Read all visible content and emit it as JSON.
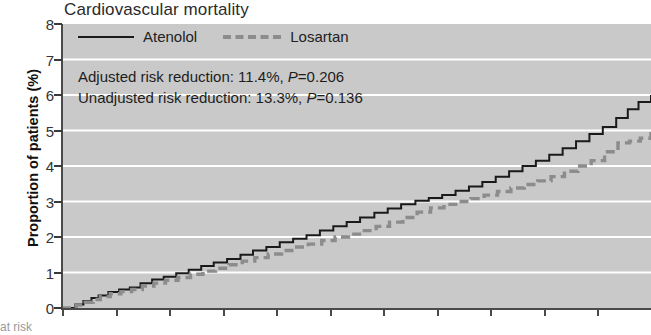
{
  "chart_data": {
    "type": "line",
    "title": "Cardiovascular mortality",
    "xlabel": "",
    "ylabel": "Proportion of patients (%)",
    "ylim": [
      0,
      8
    ],
    "yticks": [
      0,
      1,
      2,
      3,
      4,
      5,
      6,
      7,
      8
    ],
    "xlim": [
      0,
      66
    ],
    "xticks": [
      0,
      6,
      12,
      18,
      24,
      30,
      36,
      42,
      48,
      54,
      60,
      66
    ],
    "grid": true,
    "legend_position": "top-left",
    "plot_background": "#c9c9c9",
    "gridline_color": "#ffffff",
    "series": [
      {
        "name": "Atenolol",
        "style": "solid",
        "color": "#1a1a1a",
        "x": [
          0,
          1.5,
          2.4,
          3.3,
          4.1,
          5.2,
          6.4,
          7.6,
          8.8,
          10.1,
          11.4,
          12.8,
          14.2,
          15.6,
          17.0,
          18.5,
          20.0,
          21.4,
          22.9,
          24.4,
          25.9,
          27.4,
          28.9,
          30.4,
          31.9,
          33.4,
          35.0,
          36.5,
          38.0,
          39.6,
          41.1,
          42.6,
          44.1,
          45.6,
          47.1,
          48.6,
          50.1,
          51.6,
          53.1,
          54.6,
          56.1,
          57.6,
          59.1,
          60.6,
          62.1,
          63.4,
          64.6,
          66.0
        ],
        "y": [
          0.0,
          0.1,
          0.2,
          0.28,
          0.35,
          0.45,
          0.52,
          0.58,
          0.7,
          0.8,
          0.88,
          0.98,
          1.08,
          1.18,
          1.28,
          1.38,
          1.5,
          1.62,
          1.72,
          1.85,
          1.95,
          2.05,
          2.18,
          2.3,
          2.42,
          2.55,
          2.68,
          2.8,
          2.92,
          3.02,
          3.1,
          3.18,
          3.3,
          3.42,
          3.55,
          3.7,
          3.85,
          4.0,
          4.15,
          4.32,
          4.5,
          4.7,
          4.9,
          5.1,
          5.35,
          5.6,
          5.8,
          6.0
        ]
      },
      {
        "name": "Losartan",
        "style": "dashed",
        "color": "#8c8c8c",
        "x": [
          0,
          1.6,
          2.6,
          3.5,
          4.3,
          5.4,
          6.6,
          7.8,
          9.0,
          10.3,
          11.6,
          13.0,
          14.4,
          15.8,
          17.2,
          18.7,
          20.2,
          21.6,
          23.1,
          24.6,
          26.1,
          27.6,
          29.1,
          30.6,
          32.1,
          33.6,
          35.2,
          36.7,
          38.2,
          39.8,
          41.3,
          42.8,
          44.3,
          45.8,
          47.3,
          48.8,
          50.3,
          51.8,
          53.3,
          54.8,
          56.3,
          57.8,
          59.3,
          60.8,
          62.3,
          63.6,
          64.8,
          66.0
        ],
        "y": [
          0.0,
          0.08,
          0.16,
          0.24,
          0.32,
          0.4,
          0.46,
          0.52,
          0.62,
          0.7,
          0.78,
          0.86,
          0.95,
          1.04,
          1.12,
          1.22,
          1.32,
          1.42,
          1.52,
          1.62,
          1.72,
          1.8,
          1.9,
          2.0,
          2.08,
          2.18,
          2.3,
          2.42,
          2.55,
          2.7,
          2.82,
          2.92,
          3.0,
          3.08,
          3.18,
          3.28,
          3.38,
          3.48,
          3.58,
          3.7,
          3.85,
          4.0,
          4.15,
          4.4,
          4.65,
          4.7,
          4.78,
          5.0
        ]
      }
    ],
    "annotations": [
      "Adjusted risk reduction: 11.4%, P=0.206",
      "Unadjusted risk reduction: 13.3%, P=0.136"
    ]
  },
  "legend": {
    "entries": [
      {
        "label": "Atenolol"
      },
      {
        "label": "Losartan"
      }
    ]
  },
  "annotation_parts": {
    "adjusted_prefix": "Adjusted risk reduction: 11.4%, ",
    "adjusted_p_italic": "P",
    "adjusted_p_value": "=0.206",
    "unadjusted_prefix": "Unadjusted risk reduction: 13.3%, ",
    "unadjusted_p_italic": "P",
    "unadjusted_p_value": "=0.136"
  },
  "bottom_caption": "at risk"
}
